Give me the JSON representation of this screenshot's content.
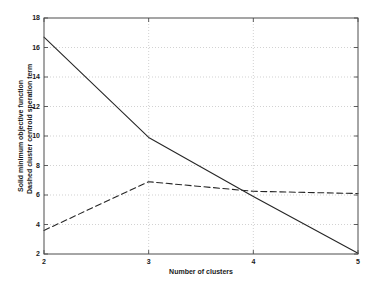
{
  "chart_data": {
    "type": "line",
    "title": "",
    "xlabel": "Number of clusters",
    "ylabel_line1": "Solid minimum objective function",
    "ylabel_line2": "Dashed cluster centroid speration term",
    "xlim": [
      2,
      5
    ],
    "ylim": [
      2,
      18
    ],
    "xticks": [
      2,
      3,
      4,
      5
    ],
    "yticks": [
      2,
      4,
      6,
      8,
      10,
      12,
      14,
      16,
      18
    ],
    "xticklabels": [
      "2",
      "3",
      "4",
      "5"
    ],
    "yticklabels": [
      "2",
      "4",
      "6",
      "8",
      "10",
      "12",
      "14",
      "16",
      "18"
    ],
    "grid": true,
    "grid_style": "dotted",
    "legend": "none",
    "x": [
      2,
      3,
      4,
      5
    ],
    "series": [
      {
        "name": "Solid minimum objective function",
        "style": "solid",
        "color": "#262626",
        "values": [
          16.7,
          9.9,
          5.9,
          2.05
        ]
      },
      {
        "name": "Dashed cluster centroid speration term",
        "style": "dashed",
        "color": "#262626",
        "values": [
          3.6,
          6.9,
          6.25,
          6.1
        ]
      }
    ],
    "axis_color": "#4d4d4d",
    "grid_color": "#b3b3b3",
    "background": "#ffffff"
  }
}
